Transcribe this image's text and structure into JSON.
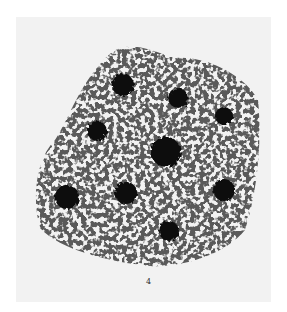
{
  "figure": {
    "label": "4",
    "colors": {
      "background": "#ffffff",
      "plate": "#f2f2f2",
      "ink": "#111111",
      "mesh": "#3a3a3a"
    },
    "nuclei": [
      {
        "cx": 123,
        "cy": 85,
        "r": 11
      },
      {
        "cx": 178,
        "cy": 98,
        "r": 10
      },
      {
        "cx": 224,
        "cy": 116,
        "r": 9
      },
      {
        "cx": 97,
        "cy": 131,
        "r": 10
      },
      {
        "cx": 166,
        "cy": 152,
        "r": 15
      },
      {
        "cx": 67,
        "cy": 197,
        "r": 12
      },
      {
        "cx": 126,
        "cy": 193,
        "r": 11
      },
      {
        "cx": 224,
        "cy": 190,
        "r": 11
      },
      {
        "cx": 169,
        "cy": 231,
        "r": 10
      }
    ]
  }
}
